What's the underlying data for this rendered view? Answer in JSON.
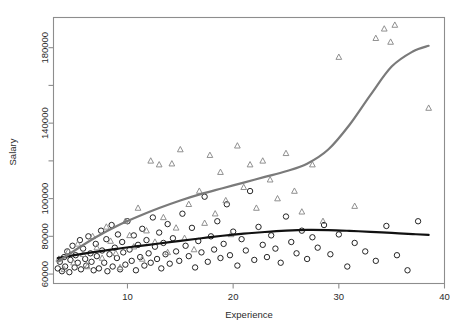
{
  "chart_data": {
    "type": "scatter",
    "title": "",
    "xlabel": "Experience",
    "ylabel": "Salary",
    "xlim": [
      3,
      40
    ],
    "ylim": [
      55000,
      196000
    ],
    "grid": false,
    "legend": "none",
    "xticks": [
      10,
      20,
      30,
      40
    ],
    "xtick_labels": [
      "10",
      "20",
      "30",
      "40"
    ],
    "yticks": [
      60000,
      80000,
      100000,
      120000,
      140000,
      160000,
      180000
    ],
    "ytick_labels": [
      "60000",
      "80000",
      "100000",
      "",
      "140000",
      "",
      "180000"
    ],
    "series": [
      {
        "name": "group-circle",
        "marker": "circle",
        "color": "#1a1a1a",
        "points": [
          [
            3.4,
            63000
          ],
          [
            3.6,
            66500
          ],
          [
            3.8,
            61500
          ],
          [
            4.0,
            69000
          ],
          [
            4.1,
            64000
          ],
          [
            4.3,
            72000
          ],
          [
            4.5,
            61000
          ],
          [
            4.6,
            67500
          ],
          [
            4.8,
            75000
          ],
          [
            5.0,
            63500
          ],
          [
            5.1,
            70000
          ],
          [
            5.3,
            66000
          ],
          [
            5.5,
            78000
          ],
          [
            5.6,
            62500
          ],
          [
            5.8,
            73500
          ],
          [
            6.0,
            68000
          ],
          [
            6.1,
            64500
          ],
          [
            6.3,
            80000
          ],
          [
            6.5,
            71000
          ],
          [
            6.6,
            66500
          ],
          [
            6.8,
            62000
          ],
          [
            7.0,
            76000
          ],
          [
            7.1,
            69500
          ],
          [
            7.3,
            63000
          ],
          [
            7.5,
            83000
          ],
          [
            7.6,
            72500
          ],
          [
            7.8,
            66000
          ],
          [
            8.0,
            78500
          ],
          [
            8.1,
            61500
          ],
          [
            8.3,
            70500
          ],
          [
            8.5,
            86000
          ],
          [
            8.6,
            64000
          ],
          [
            8.8,
            74000
          ],
          [
            9.0,
            68500
          ],
          [
            9.1,
            81000
          ],
          [
            9.3,
            62500
          ],
          [
            9.5,
            77000
          ],
          [
            9.6,
            71500
          ],
          [
            9.8,
            65000
          ],
          [
            10.0,
            88000
          ],
          [
            10.2,
            73000
          ],
          [
            10.4,
            67000
          ],
          [
            10.6,
            80500
          ],
          [
            10.8,
            62000
          ],
          [
            11.0,
            75500
          ],
          [
            11.2,
            69000
          ],
          [
            11.4,
            84000
          ],
          [
            11.6,
            64500
          ],
          [
            11.8,
            78000
          ],
          [
            12.0,
            71000
          ],
          [
            12.2,
            66000
          ],
          [
            12.4,
            90000
          ],
          [
            12.6,
            74500
          ],
          [
            12.8,
            68000
          ],
          [
            13.0,
            82000
          ],
          [
            13.2,
            63000
          ],
          [
            13.4,
            76500
          ],
          [
            13.6,
            70500
          ],
          [
            13.8,
            86500
          ],
          [
            14.0,
            65500
          ],
          [
            14.3,
            79000
          ],
          [
            14.6,
            72000
          ],
          [
            14.9,
            67000
          ],
          [
            15.2,
            92000
          ],
          [
            15.5,
            75000
          ],
          [
            15.8,
            69500
          ],
          [
            16.1,
            84500
          ],
          [
            16.4,
            63500
          ],
          [
            16.7,
            77500
          ],
          [
            17.0,
            71500
          ],
          [
            17.3,
            101000
          ],
          [
            17.6,
            66500
          ],
          [
            17.9,
            80000
          ],
          [
            18.2,
            73000
          ],
          [
            18.5,
            88000
          ],
          [
            18.8,
            68500
          ],
          [
            19.1,
            76000
          ],
          [
            19.4,
            97000
          ],
          [
            19.7,
            70000
          ],
          [
            20.0,
            82500
          ],
          [
            20.4,
            64500
          ],
          [
            20.8,
            78500
          ],
          [
            21.2,
            72500
          ],
          [
            21.6,
            104000
          ],
          [
            22.0,
            67500
          ],
          [
            22.4,
            85000
          ],
          [
            22.8,
            75500
          ],
          [
            23.2,
            69000
          ],
          [
            23.6,
            80500
          ],
          [
            24.0,
            73500
          ],
          [
            24.5,
            66000
          ],
          [
            25.0,
            90500
          ],
          [
            25.5,
            77000
          ],
          [
            26.0,
            71000
          ],
          [
            26.5,
            83000
          ],
          [
            27.0,
            68000
          ],
          [
            27.5,
            79500
          ],
          [
            28.0,
            74000
          ],
          [
            28.6,
            86000
          ],
          [
            29.2,
            70500
          ],
          [
            30.0,
            81000
          ],
          [
            30.8,
            64000
          ],
          [
            31.5,
            76500
          ],
          [
            32.5,
            72000
          ],
          [
            33.5,
            67000
          ],
          [
            34.5,
            85500
          ],
          [
            35.5,
            70000
          ],
          [
            36.5,
            62000
          ],
          [
            37.5,
            88000
          ]
        ]
      },
      {
        "name": "group-triangle",
        "marker": "triangle",
        "color": "#8a8a8a",
        "points": [
          [
            3.5,
            68000
          ],
          [
            4.0,
            62500
          ],
          [
            4.4,
            72000
          ],
          [
            4.9,
            66000
          ],
          [
            5.3,
            76000
          ],
          [
            5.8,
            70500
          ],
          [
            6.2,
            64000
          ],
          [
            6.7,
            80000
          ],
          [
            7.1,
            74000
          ],
          [
            7.6,
            68500
          ],
          [
            8.0,
            85000
          ],
          [
            8.4,
            77500
          ],
          [
            8.9,
            71000
          ],
          [
            9.3,
            63500
          ],
          [
            9.8,
            88000
          ],
          [
            10.2,
            80500
          ],
          [
            10.6,
            74500
          ],
          [
            11.0,
            95000
          ],
          [
            11.4,
            68000
          ],
          [
            11.8,
            83000
          ],
          [
            12.2,
            120000
          ],
          [
            12.6,
            77000
          ],
          [
            13.0,
            118000
          ],
          [
            13.4,
            90000
          ],
          [
            13.8,
            71500
          ],
          [
            14.2,
            118500
          ],
          [
            14.6,
            84500
          ],
          [
            15.0,
            126000
          ],
          [
            15.4,
            79000
          ],
          [
            15.8,
            97000
          ],
          [
            16.3,
            73000
          ],
          [
            16.8,
            104000
          ],
          [
            17.3,
            87000
          ],
          [
            17.8,
            123000
          ],
          [
            18.3,
            92000
          ],
          [
            18.8,
            114000
          ],
          [
            19.3,
            99000
          ],
          [
            19.8,
            81000
          ],
          [
            20.4,
            128000
          ],
          [
            21.0,
            106000
          ],
          [
            21.6,
            118000
          ],
          [
            22.2,
            95000
          ],
          [
            22.8,
            120000
          ],
          [
            23.5,
            110000
          ],
          [
            24.2,
            100000
          ],
          [
            25.0,
            124000
          ],
          [
            25.8,
            104000
          ],
          [
            26.5,
            93000
          ],
          [
            27.5,
            118000
          ],
          [
            28.5,
            88000
          ],
          [
            30.0,
            175000
          ],
          [
            31.5,
            96000
          ],
          [
            33.5,
            185000
          ],
          [
            34.3,
            190000
          ],
          [
            34.9,
            183000
          ],
          [
            35.3,
            192000
          ],
          [
            38.5,
            148000
          ]
        ]
      }
    ],
    "smoothers": [
      {
        "name": "lowess-circle",
        "color": "#111111",
        "width": 2.2,
        "points": [
          [
            3.4,
            68500
          ],
          [
            5.0,
            70000
          ],
          [
            7.0,
            71800
          ],
          [
            9.0,
            73400
          ],
          [
            11.0,
            74800
          ],
          [
            13.0,
            76200
          ],
          [
            15.0,
            77600
          ],
          [
            17.0,
            79000
          ],
          [
            19.0,
            80300
          ],
          [
            21.0,
            81400
          ],
          [
            23.0,
            82300
          ],
          [
            25.0,
            83000
          ],
          [
            27.0,
            83400
          ],
          [
            29.0,
            83300
          ],
          [
            31.0,
            82900
          ],
          [
            33.0,
            82400
          ],
          [
            35.0,
            81800
          ],
          [
            37.0,
            81200
          ],
          [
            38.5,
            80800
          ]
        ]
      },
      {
        "name": "lowess-triangle",
        "color": "#7a7a7a",
        "width": 2.2,
        "points": [
          [
            3.4,
            66500
          ],
          [
            5.0,
            72500
          ],
          [
            7.0,
            79500
          ],
          [
            9.0,
            85500
          ],
          [
            11.0,
            90500
          ],
          [
            13.0,
            95000
          ],
          [
            15.0,
            99000
          ],
          [
            17.0,
            102500
          ],
          [
            19.0,
            105500
          ],
          [
            21.0,
            108500
          ],
          [
            23.0,
            111500
          ],
          [
            25.0,
            114500
          ],
          [
            27.0,
            118500
          ],
          [
            29.0,
            126000
          ],
          [
            31.0,
            139000
          ],
          [
            33.0,
            155000
          ],
          [
            35.0,
            170000
          ],
          [
            37.0,
            178000
          ],
          [
            38.5,
            181000
          ]
        ]
      }
    ]
  }
}
